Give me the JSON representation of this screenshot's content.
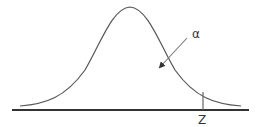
{
  "diagram": {
    "type": "normal-distribution-right-tail",
    "labels": {
      "alpha": "α",
      "critical_value": "Z"
    },
    "colors": {
      "curve": "#555555",
      "baseline": "#333333",
      "marker": "#666666",
      "arrow": "#666666",
      "text": "#333333"
    }
  }
}
